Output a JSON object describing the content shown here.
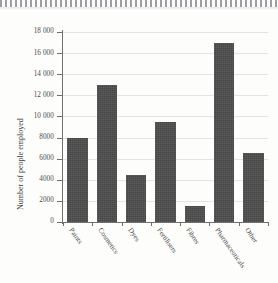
{
  "chart_data": {
    "type": "bar",
    "title": "",
    "xlabel": "",
    "ylabel": "Number of people employed",
    "categories": [
      "Paints",
      "Cosmetics",
      "Dyes",
      "Fertilisers",
      "Fibres",
      "Pharmaceuticals",
      "Other"
    ],
    "values": [
      8000,
      13000,
      4500,
      9500,
      1500,
      17000,
      6500
    ],
    "ylim": [
      0,
      18000
    ],
    "ytick_values": [
      0,
      2000,
      4000,
      6000,
      8000,
      10000,
      12000,
      14000,
      16000,
      18000
    ],
    "ytick_labels": [
      "0",
      "2000",
      "4000",
      "6000",
      "8000",
      "10 000",
      "12 000",
      "14 000",
      "16 000",
      "18 000"
    ],
    "grid": true,
    "legend": null,
    "bar_color": "#4d4d4d",
    "grid_color": "#e3e3e3",
    "axis_color": "#6f6f6f",
    "background": "#fdfdfc"
  }
}
